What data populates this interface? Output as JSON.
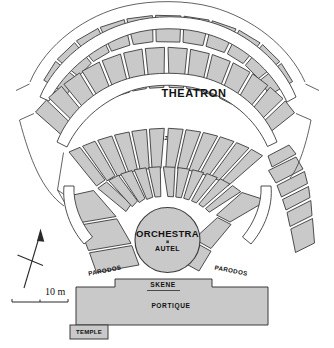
{
  "plan": {
    "title_label": "THEATRON",
    "orchestra_label": "ORCHESTRA",
    "altar_label": "AUTEL",
    "diazoma_label": "DIAZOMA",
    "parodos_left_label": "PARODOS",
    "parodos_right_label": "PARODOS",
    "skene_label": "SKENE",
    "portique_label": "PORTIQUE",
    "temple_label": "TEMPLE",
    "scale_label": "10 m",
    "colors": {
      "stone_fill": "#c9c9c9",
      "outline": "#3b3b3b",
      "walkway": "#ffffff",
      "text": "#111111",
      "background": "#ffffff"
    }
  }
}
